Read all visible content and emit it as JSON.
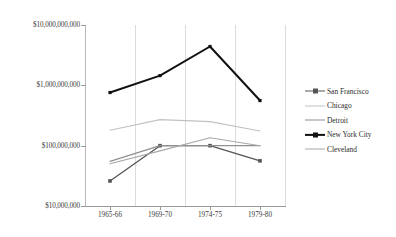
{
  "chart_data": {
    "type": "line",
    "title": "",
    "xlabel": "",
    "ylabel": "",
    "yscale": "log",
    "ylim": [
      10000000,
      10000000000
    ],
    "grid": "vertical",
    "legend_position": "right",
    "categories": [
      "1965-66",
      "1969-70",
      "1974-75",
      "1979-80"
    ],
    "ytick_labels": [
      "$10,000,000,000",
      "$1,000,000,000",
      "$100,000,000",
      "$10,000,000"
    ],
    "ytick_values": [
      10000000000,
      1000000000,
      100000000,
      10000000
    ],
    "series": [
      {
        "name": "San Francisco",
        "color": "#555555",
        "marker": "square",
        "width": 1.3,
        "values": [
          26000000,
          100000000,
          100000000,
          56000000
        ]
      },
      {
        "name": "Chicago",
        "color": "#c2c2c2",
        "marker": "none",
        "width": 1.1,
        "values": [
          180000000,
          270000000,
          250000000,
          175000000
        ]
      },
      {
        "name": "Detroit",
        "color": "#8f8f8f",
        "marker": "none",
        "width": 1.2,
        "values": [
          55000000,
          100000000,
          100000000,
          100000000
        ]
      },
      {
        "name": "New York City",
        "color": "#111111",
        "marker": "square",
        "width": 2.0,
        "values": [
          760000000,
          1450000000,
          4400000000,
          560000000
        ]
      },
      {
        "name": "Cleveland",
        "color": "#a8a8a8",
        "marker": "none",
        "width": 1.1,
        "values": [
          50000000,
          82000000,
          135000000,
          100000000
        ]
      }
    ]
  },
  "legend": {
    "items": [
      {
        "label": "San Francisco"
      },
      {
        "label": "Chicago"
      },
      {
        "label": "Detroit"
      },
      {
        "label": "New York City"
      },
      {
        "label": "Cleveland"
      }
    ]
  }
}
